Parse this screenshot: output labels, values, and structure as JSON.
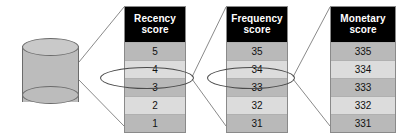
{
  "diagram": {
    "source": {
      "name": "customer-database",
      "shape": "cylinder",
      "fill_color": "#bcbcbc",
      "stroke_color": "#6b6b6b"
    },
    "header_background": "#000000",
    "header_text_color": "#ffffff",
    "row_shade_dark": "#b9b9b9",
    "row_shade_light": "#dcdcdc",
    "highlight_stroke": "#4a4a4a",
    "connector_stroke": "#8a8a8a",
    "tables": [
      {
        "id": "recency",
        "header_line1": "Recency",
        "header_line2": "score",
        "rows": [
          "5",
          "4",
          "3",
          "2",
          "1"
        ],
        "highlighted_row_index": 2,
        "highlighted_value": "3"
      },
      {
        "id": "frequency",
        "header_line1": "Frequency",
        "header_line2": "score",
        "rows": [
          "35",
          "34",
          "33",
          "32",
          "31"
        ],
        "highlighted_row_index": 2,
        "highlighted_value": "33"
      },
      {
        "id": "monetary",
        "header_line1": "Monetary",
        "header_line2": "score",
        "rows": [
          "335",
          "334",
          "333",
          "332",
          "331"
        ],
        "highlighted_row_index": 2,
        "highlighted_value": "333"
      }
    ]
  }
}
